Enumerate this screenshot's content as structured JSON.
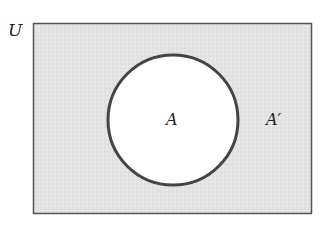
{
  "diagram": {
    "type": "venn",
    "universe_label": "U",
    "set_label": "A",
    "complement_label": "A′",
    "colors": {
      "universe_fill": "#e4e4e4",
      "set_fill": "#ffffff",
      "stroke": "#444444"
    }
  }
}
